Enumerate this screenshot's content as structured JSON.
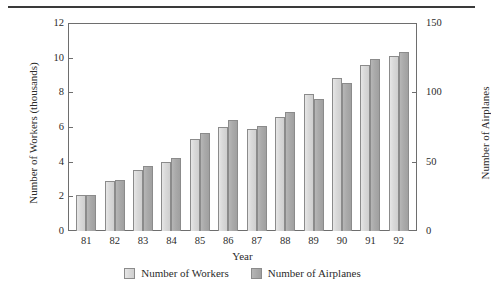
{
  "chart_data": {
    "type": "bar",
    "title": "",
    "subtitle": "",
    "xlabel": "Year",
    "ylabel": "Number of Workers (thousands)",
    "y2label": "Number of Airplanes",
    "categories": [
      "81",
      "82",
      "83",
      "84",
      "85",
      "86",
      "87",
      "88",
      "89",
      "90",
      "91",
      "92"
    ],
    "series": [
      {
        "name": "Number of Workers",
        "axis": "left",
        "color": "#d9d9d9",
        "values": [
          2.1,
          2.9,
          3.5,
          4.0,
          5.3,
          6.0,
          5.9,
          6.6,
          7.9,
          8.8,
          9.6,
          10.1
        ]
      },
      {
        "name": "Number of Airplanes",
        "axis": "right",
        "color": "#aaaaaa",
        "values": [
          26,
          37,
          47,
          53,
          71,
          80,
          76,
          86,
          95,
          107,
          124,
          129
        ]
      }
    ],
    "ylim": [
      0,
      12
    ],
    "y2lim": [
      0,
      150
    ],
    "yticks": [
      0,
      2,
      4,
      6,
      8,
      10,
      12
    ],
    "y2ticks": [
      0,
      50,
      100,
      150
    ],
    "grid": false,
    "legend_position": "bottom"
  },
  "axes": {
    "left_ticks": [
      "0",
      "2",
      "4",
      "6",
      "8",
      "10",
      "12"
    ],
    "right_ticks": [
      "0",
      "50",
      "100",
      "150"
    ],
    "x_ticks": [
      "81",
      "82",
      "83",
      "84",
      "85",
      "86",
      "87",
      "88",
      "89",
      "90",
      "91",
      "92"
    ],
    "left_title": "Number of Workers (thousands)",
    "right_title": "Number of Airplanes",
    "x_title": "Year"
  },
  "legend": {
    "items": [
      {
        "label": "Number of Workers"
      },
      {
        "label": "Number of Airplanes"
      }
    ]
  }
}
